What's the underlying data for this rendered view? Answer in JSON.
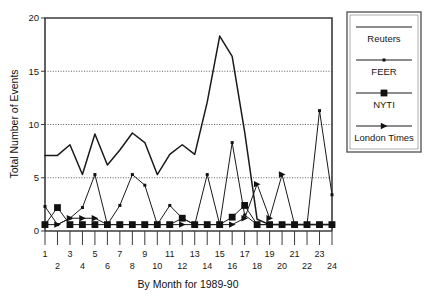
{
  "chart_data": {
    "type": "line",
    "title": "",
    "xlabel": "By Month for 1989-90",
    "ylabel": "Total Number of Events",
    "xlim": [
      1,
      24
    ],
    "ylim": [
      0,
      20
    ],
    "yticks": [
      0,
      5,
      10,
      15,
      20
    ],
    "ytick_labels": [
      "0",
      "5",
      "10",
      "15",
      "20"
    ],
    "grid": "horizontal-dotted-at-5-10-15",
    "legend_position": "right-outside",
    "categories": [
      1,
      2,
      3,
      4,
      5,
      6,
      7,
      8,
      9,
      10,
      11,
      12,
      13,
      14,
      15,
      16,
      17,
      18,
      19,
      20,
      21,
      22,
      23,
      24
    ],
    "xtick_labels": [
      "1",
      "2",
      "3",
      "4",
      "5",
      "6",
      "7",
      "8",
      "9",
      "10",
      "11",
      "12",
      "13",
      "14",
      "15",
      "16",
      "17",
      "18",
      "19",
      "20",
      "21",
      "22",
      "23",
      "24"
    ],
    "series": [
      {
        "name": "Reuters",
        "marker": "none",
        "values": [
          7.1,
          7.1,
          8.1,
          5.3,
          9.1,
          6.2,
          7.6,
          9.2,
          8.3,
          5.3,
          7.2,
          8.1,
          7.2,
          12.1,
          18.3,
          16.4,
          9.3,
          1.1,
          0.6,
          0.6,
          0.6,
          0.6,
          0.6,
          0.6
        ]
      },
      {
        "name": "FEER",
        "marker": "dot",
        "values": [
          2.3,
          0.6,
          1.2,
          2.2,
          5.3,
          0.6,
          2.4,
          5.3,
          4.3,
          0.6,
          2.4,
          1.2,
          0.6,
          5.3,
          0.6,
          8.3,
          1.5,
          0.6,
          0.6,
          0.6,
          0.6,
          0.6,
          11.3,
          3.4
        ]
      },
      {
        "name": "NYTI",
        "marker": "square",
        "values": [
          0.6,
          2.2,
          0.6,
          0.6,
          0.6,
          0.6,
          0.6,
          0.6,
          0.6,
          0.6,
          0.6,
          1.2,
          0.6,
          0.6,
          0.6,
          1.3,
          2.4,
          0.6,
          0.6,
          0.6,
          0.6,
          0.6,
          0.6,
          0.6
        ]
      },
      {
        "name": "London Times",
        "marker": "triangle",
        "values": [
          0.6,
          0.6,
          1.2,
          1.2,
          1.2,
          0.6,
          0.6,
          0.6,
          0.6,
          0.6,
          0.6,
          0.6,
          0.6,
          0.6,
          0.6,
          0.6,
          1.2,
          4.4,
          1.2,
          5.3,
          0.6,
          0.6,
          0.6,
          0.6
        ]
      }
    ]
  },
  "legend": {
    "entries": [
      {
        "label": "Reuters",
        "marker": "none"
      },
      {
        "label": "FEER",
        "marker": "dot"
      },
      {
        "label": "NYTI",
        "marker": "square"
      },
      {
        "label": "London Times",
        "marker": "triangle"
      }
    ]
  },
  "colors": {
    "ink": "#1a1a1a",
    "axis": "#3b3b3b",
    "grid": "#4a4a4a",
    "legend_border": "#5a5a5a",
    "background": "#ffffff"
  }
}
